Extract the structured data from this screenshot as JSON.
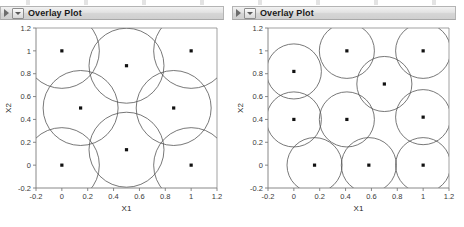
{
  "panels": [
    {
      "title": "Overlay Plot",
      "icons": {
        "disclosure": "triangle-right-icon",
        "menu": "dropdown-menu-icon"
      },
      "chart_data": {
        "type": "scatter",
        "title": "Overlay Plot",
        "xlabel": "X1",
        "ylabel": "X2",
        "xlim": [
          -0.2,
          1.2
        ],
        "ylim": [
          -0.2,
          1.2
        ],
        "xticks": [
          "-0.2",
          "0",
          "0.2",
          "0.4",
          "0.6",
          "0.8",
          "1",
          "1.2"
        ],
        "xtickvalues": [
          -0.2,
          0,
          0.2,
          0.4,
          0.6,
          0.8,
          1,
          1.2
        ],
        "yticks": [
          "-0.2",
          "0",
          "0.2",
          "0.4",
          "0.6",
          "0.8",
          "1",
          "1.2"
        ],
        "ytickvalues": [
          -0.2,
          0,
          0.2,
          0.4,
          0.6,
          0.8,
          1,
          1.2
        ],
        "grid": false,
        "legend": "none",
        "marker": "filled-square",
        "circle_radius": 0.29,
        "points": [
          {
            "x": 0.0,
            "y": 1.0
          },
          {
            "x": 0.5,
            "y": 0.87
          },
          {
            "x": 1.0,
            "y": 1.0
          },
          {
            "x": 0.145,
            "y": 0.5
          },
          {
            "x": 0.865,
            "y": 0.5
          },
          {
            "x": 0.0,
            "y": 0.0
          },
          {
            "x": 0.5,
            "y": 0.135
          },
          {
            "x": 1.0,
            "y": 0.0
          }
        ]
      }
    },
    {
      "title": "Overlay Plot",
      "icons": {
        "disclosure": "triangle-right-icon",
        "menu": "dropdown-menu-icon"
      },
      "chart_data": {
        "type": "scatter",
        "title": "Overlay Plot",
        "xlabel": "X1",
        "ylabel": "X2",
        "xlim": [
          -0.2,
          1.2
        ],
        "ylim": [
          -0.2,
          1.2
        ],
        "xticks": [
          "-0.2",
          "0",
          "0.2",
          "0.4",
          "0.6",
          "0.8",
          "1",
          "1.2"
        ],
        "xtickvalues": [
          -0.2,
          0,
          0.2,
          0.4,
          0.6,
          0.8,
          1,
          1.2
        ],
        "yticks": [
          "-0.2",
          "0",
          "0.2",
          "0.4",
          "0.6",
          "0.8",
          "1",
          "1.2"
        ],
        "ytickvalues": [
          -0.2,
          0,
          0.2,
          0.4,
          0.6,
          0.8,
          1,
          1.2
        ],
        "grid": false,
        "legend": "none",
        "marker": "filled-square",
        "circle_radius": 0.213,
        "points": [
          {
            "x": 0.0,
            "y": 0.82
          },
          {
            "x": 0.41,
            "y": 1.0
          },
          {
            "x": 1.0,
            "y": 1.0
          },
          {
            "x": 0.7,
            "y": 0.71
          },
          {
            "x": 0.0,
            "y": 0.4
          },
          {
            "x": 0.41,
            "y": 0.4
          },
          {
            "x": 1.0,
            "y": 0.42
          },
          {
            "x": 0.16,
            "y": 0.0
          },
          {
            "x": 0.58,
            "y": 0.0
          },
          {
            "x": 1.0,
            "y": 0.0
          }
        ]
      }
    }
  ],
  "colors": {
    "circle_stroke": "#555555",
    "marker_fill": "#111111",
    "axis": "#7a7a7a",
    "titlebar_text": "#1a1a1a",
    "plot_background": "#ffffff"
  }
}
